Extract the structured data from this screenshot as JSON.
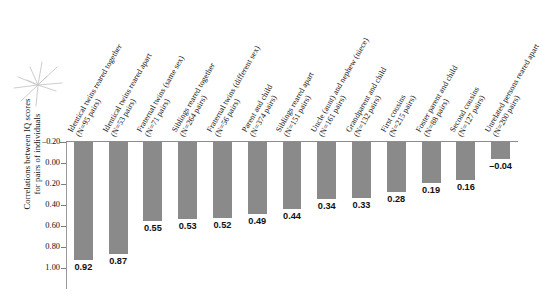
{
  "chart_data": {
    "type": "bar",
    "title": "",
    "subtitle": "",
    "xlabel": "",
    "ylabel": "Correlations between IQ scores for pairs of individuals",
    "ylabel_lines": [
      "Correlations between IQ scores",
      "for pairs of individuals"
    ],
    "ylim": [
      -0.2,
      1.0
    ],
    "y_inverted": true,
    "yticks": [
      "–0.20",
      "0.00",
      "0.20",
      "0.40",
      "0.60",
      "0.80",
      "1.00"
    ],
    "ytick_values": [
      -0.2,
      0.0,
      0.2,
      0.4,
      0.6,
      0.8,
      1.0
    ],
    "grid": false,
    "legend": "none",
    "bar_color": "#8a8a8a",
    "axis_color": "#8d8d8d",
    "categories": [
      "Identical twins reared together (N=95 pairs)",
      "Identical twins reared apart (N=53 pairs)",
      "Fraternal twins (same sex) (N=71 pairs)",
      "Siblings reared together (N=264 pairs)",
      "Fraternal twins (different sex) (N=56 pairs)",
      "Parent and child (N=374 pairs)",
      "Siblings reared apart (N=151 pairs)",
      "Uncle (aunt) and nephew (niece) (N=161 pairs)",
      "Grandparent and child (N=132 pairs)",
      "First cousins (N=215 pairs)",
      "Foster parent and child (N=88 pairs)",
      "Second cousins (N=127 pairs)",
      "Unrelated persons reared apart (N=200 pairs)"
    ],
    "category_lines": [
      [
        "Identical twins reared together",
        "(N=95 pairs)"
      ],
      [
        "Identical twins reared apart",
        "(N=53 pairs)"
      ],
      [
        "Fraternal twins (same sex)",
        "(N=71 pairs)"
      ],
      [
        "Siblings reared together",
        "(N=264 pairs)"
      ],
      [
        "Fraternal twins (different sex)",
        "(N=56 pairs)"
      ],
      [
        "Parent and child",
        "(N=374 pairs)"
      ],
      [
        "Siblings reared apart",
        "(N=151 pairs)"
      ],
      [
        "Uncle (aunt) and nephew (niece)",
        "(N=161 pairs)"
      ],
      [
        "Grandparent and child",
        "(N=132 pairs)"
      ],
      [
        "First cousins",
        "(N=215 pairs)"
      ],
      [
        "Foster parent and child",
        "(N=88 pairs)"
      ],
      [
        "Second cousins",
        "(N=127 pairs)"
      ],
      [
        "Unrelated persons reared apart",
        "(N=200 pairs)"
      ]
    ],
    "values": [
      0.92,
      0.87,
      0.55,
      0.53,
      0.52,
      0.49,
      0.44,
      0.34,
      0.33,
      0.28,
      0.19,
      0.16,
      -0.04
    ],
    "value_labels": [
      "0.92",
      "0.87",
      "0.55",
      "0.53",
      "0.52",
      "0.49",
      "0.44",
      "0.34",
      "0.33",
      "0.28",
      "0.19",
      "0.16",
      "–0.04"
    ],
    "sample_sizes": [
      95,
      53,
      71,
      264,
      56,
      374,
      151,
      161,
      132,
      215,
      88,
      127,
      200
    ]
  },
  "annotations": {
    "starburst": "pencil-starburst-mark"
  }
}
